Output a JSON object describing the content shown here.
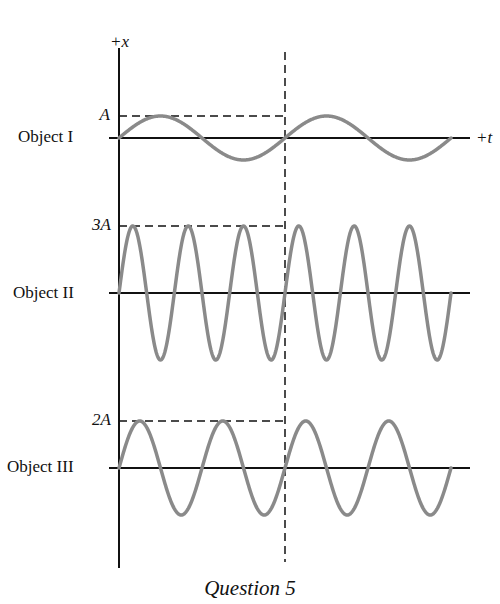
{
  "figure": {
    "caption": "Question 5",
    "axis_labels": {
      "vertical": "+x",
      "horizontal": "+t"
    },
    "colors": {
      "axis": "#111111",
      "wave": "#8a8a8a",
      "dash": "#111111"
    },
    "objects": [
      {
        "name": "Object I",
        "amplitude_label": "A",
        "amplitude": 1,
        "periods_shown": 2,
        "zero_y": 138,
        "peak_y": 116,
        "period_px": 166
      },
      {
        "name": "Object II",
        "amplitude_label": "3A",
        "amplitude": 3,
        "periods_shown": 6,
        "zero_y": 293,
        "peak_y": 226,
        "period_px": 55.3
      },
      {
        "name": "Object III",
        "amplitude_label": "2A",
        "amplitude": 2,
        "periods_shown": 4,
        "zero_y": 468,
        "peak_y": 421,
        "period_px": 83
      }
    ],
    "geometry": {
      "origin_x": 119,
      "axis_top_y": 48,
      "axis_bottom_y": 568,
      "axis_end_x": 470,
      "wave_end_x": 451,
      "dashed_x": 285,
      "dashed_top_y": 52,
      "dashed_bottom_y": 562
    }
  },
  "chart_data": {
    "type": "line",
    "title": "Question 5",
    "xlabel": "+t",
    "ylabel": "+x",
    "grid": false,
    "series": [
      {
        "name": "Object I",
        "amplitude": "A",
        "cycles_shown": 2,
        "cycles_before_dashed_line": 1
      },
      {
        "name": "Object II",
        "amplitude": "3A",
        "cycles_shown": 6,
        "cycles_before_dashed_line": 3
      },
      {
        "name": "Object III",
        "amplitude": "2A",
        "cycles_shown": 4,
        "cycles_before_dashed_line": 2
      }
    ],
    "annotations": [
      "A",
      "3A",
      "2A",
      "dashed vertical reference line at end of Object I's first period"
    ]
  }
}
